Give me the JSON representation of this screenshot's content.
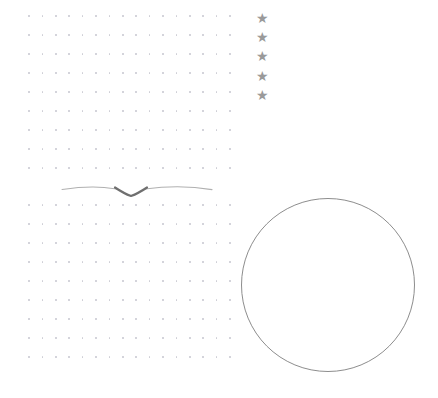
{
  "canvas": {
    "width": 438,
    "height": 398,
    "background_color": "#ffffff"
  },
  "palette": {
    "dot_color": "#b9b9c4",
    "star_color": "#9a9a9a",
    "circle_stroke_color": "#8d8d8d",
    "divider_line_color": "#b0b0b0",
    "divider_accent_color": "#6f6f6f"
  },
  "elements": {
    "upper_dot_grid": {
      "name": "upper dot grid",
      "columns": 16,
      "rows": 9,
      "origin_x": 29,
      "origin_y": 16,
      "col_spacing": 13.4,
      "row_spacing": 19.0,
      "dot_size": 1.6,
      "color": "#b9b9c4",
      "opacity": 0.72
    },
    "lower_dot_grid": {
      "name": "lower dot grid",
      "columns": 16,
      "rows": 9,
      "origin_x": 29,
      "origin_y": 205,
      "col_spacing": 13.4,
      "row_spacing": 19.0,
      "dot_size": 1.6,
      "color": "#b9b9c4",
      "opacity": 0.72
    },
    "divider": {
      "name": "wavy divider with center v-dip",
      "left_x": 62,
      "right_x": 212,
      "baseline_y": 188,
      "dip_center_x": 131,
      "dip_depth_y": 196,
      "line_color": "#b0b0b0",
      "accent_color": "#6f6f6f",
      "stroke_width": 1.1
    },
    "star_column": {
      "name": "star rating column",
      "glyph": "★",
      "count": 5,
      "center_x": 264,
      "first_y": 18,
      "spacing_y": 19.2,
      "size": 14,
      "color": "#9a9a9a"
    },
    "circle": {
      "name": "large circle outline",
      "center_x": 328,
      "center_y": 285,
      "radius": 87,
      "stroke_color": "#8d8d8d",
      "stroke_width": 1.1,
      "fill": "none"
    }
  }
}
